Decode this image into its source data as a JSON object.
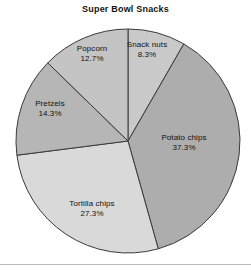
{
  "chart_data": {
    "type": "pie",
    "title": "Super Bowl Snacks",
    "xlabel": "",
    "ylabel": "",
    "legend": "none",
    "grid": false,
    "start_angle_deg": 0,
    "direction": "clockwise",
    "center": {
      "x": 128,
      "y": 141
    },
    "radius": 112,
    "categories": [
      "Snack nuts",
      "Potato chips",
      "Tortilla chips",
      "Pretzels",
      "Popcorn"
    ],
    "values": [
      8.3,
      37.3,
      27.3,
      14.3,
      12.7
    ],
    "value_unit": "%",
    "slices": [
      {
        "label": "Snack nuts",
        "value": 8.3,
        "value_text": "8.3%",
        "color": "#c9c9c9",
        "label_x": 147,
        "label_y": 45
      },
      {
        "label": "Potato chips",
        "value": 37.3,
        "value_text": "37.3%",
        "color": "#adadad",
        "label_x": 184,
        "label_y": 138
      },
      {
        "label": "Tortilla chips",
        "value": 27.3,
        "value_text": "27.3%",
        "color": "#d9d9d9",
        "label_x": 92,
        "label_y": 204
      },
      {
        "label": "Pretzels",
        "value": 14.3,
        "value_text": "14.3%",
        "color": "#b6b6b6",
        "label_x": 50,
        "label_y": 104
      },
      {
        "label": "Popcorn",
        "value": 12.7,
        "value_text": "12.7%",
        "color": "#c4c4c4",
        "label_x": 92,
        "label_y": 49
      }
    ],
    "outline_color": "#3a3a3a",
    "background": "#ffffff"
  },
  "decor": {
    "bottom_rule_color": "#b9b9b9"
  }
}
